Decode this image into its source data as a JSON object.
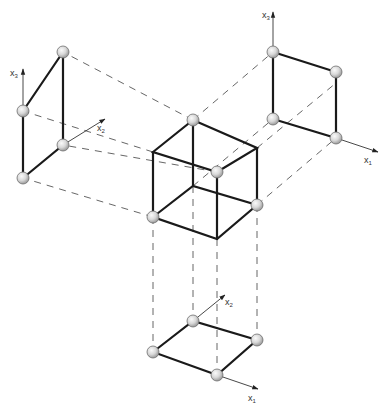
{
  "figure": {
    "colors": {
      "edge": "#1a1a1a",
      "dash": "#555555",
      "node_fill_light": "#f2f2f2",
      "node_fill_dark": "#a8a8a8",
      "background": "#ffffff"
    },
    "axes_labels": {
      "left_vertical": {
        "base": "x",
        "sub": "3"
      },
      "left_diagonal": {
        "base": "x",
        "sub": "2"
      },
      "right_vertical": {
        "base": "x",
        "sub": "3"
      },
      "right_horizontal": {
        "base": "x",
        "sub": "1"
      },
      "bottom_diagonal": {
        "base": "x",
        "sub": "2"
      },
      "bottom_horizontal": {
        "base": "x",
        "sub": "1"
      }
    },
    "views": [
      {
        "name": "cube-3d",
        "node_count": 4
      },
      {
        "name": "projection-x2-x3",
        "node_count": 4
      },
      {
        "name": "projection-x1-x3",
        "node_count": 4
      },
      {
        "name": "projection-x1-x2",
        "node_count": 4
      }
    ]
  }
}
